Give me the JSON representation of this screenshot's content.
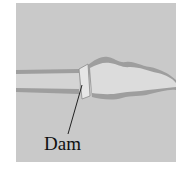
{
  "diagram": {
    "labels": {
      "dam": "Dam"
    },
    "colors": {
      "background": "#c9c9c9",
      "river_bank": "#9e9e9e",
      "water": "#dcdcdc",
      "dam": "#e6e6e6",
      "leader_line": "#222222"
    }
  }
}
